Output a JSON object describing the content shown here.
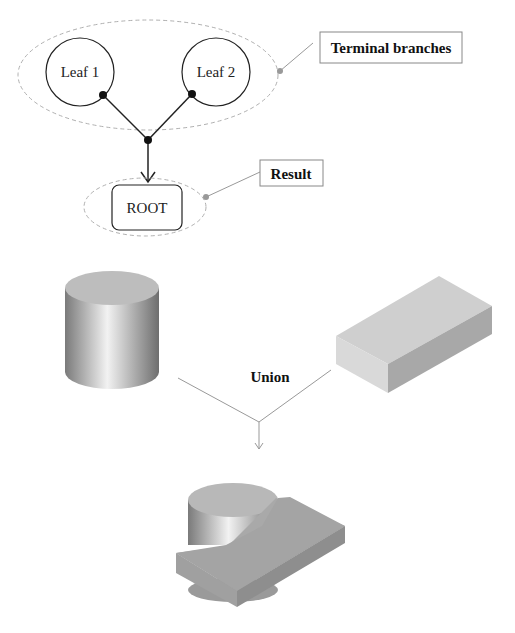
{
  "tree": {
    "leaves": [
      {
        "label": "Leaf 1"
      },
      {
        "label": "Leaf 2"
      }
    ],
    "root": {
      "label": "ROOT"
    },
    "callouts": {
      "terminal": "Terminal branches",
      "result": "Result"
    }
  },
  "operation": {
    "label": "Union",
    "inputs": [
      "cylinder",
      "box"
    ],
    "output": "cylinder-box-union"
  },
  "colors": {
    "line": "#222222",
    "dashed": "#aaaaaa",
    "callout_line": "#999999",
    "solid_fill": "#cccccc"
  }
}
